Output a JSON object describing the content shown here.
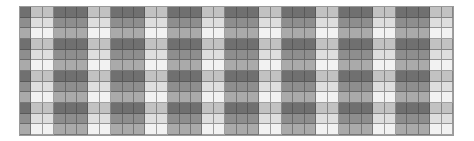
{
  "pattern": {
    "columns": 38,
    "rows": 12,
    "column_tones": [
      "D",
      "L",
      "L",
      "D",
      "D",
      "D",
      "L",
      "L",
      "D",
      "D",
      "D",
      "L",
      "L",
      "D",
      "D",
      "D",
      "L",
      "L",
      "D",
      "D",
      "D",
      "L",
      "L",
      "D",
      "D",
      "D",
      "L",
      "L",
      "D",
      "D",
      "D",
      "L",
      "L",
      "D",
      "D",
      "D",
      "L",
      "L"
    ],
    "row_tones": [
      "dark",
      "medium",
      "light",
      "dark",
      "medium",
      "light",
      "dark",
      "medium",
      "light",
      "dark",
      "medium",
      "light"
    ],
    "colors": {
      "dark": {
        "D": "#707070",
        "L": "#c2c2c2"
      },
      "medium": {
        "D": "#8e8e8e",
        "L": "#dedede"
      },
      "light": {
        "D": "#aaaaaa",
        "L": "#f2f2f2"
      }
    }
  }
}
